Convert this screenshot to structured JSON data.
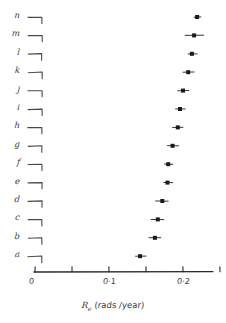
{
  "chart_data": {
    "type": "scatter",
    "title": "",
    "xlabel": "R_e (rads/year)",
    "xlabel_symbol": "R",
    "xlabel_subscript": "e",
    "xlabel_units": "(rads /year)",
    "ylabel": "",
    "xlim": [
      0,
      0.25
    ],
    "grid": false,
    "legend": null,
    "orientation": "horizontal",
    "style": "hand-drawn dot plot with horizontal error bars",
    "xticks": [
      0,
      0.05,
      0.1,
      0.15,
      0.2,
      0.25
    ],
    "xtick_labels": [
      "0",
      "",
      "0·1",
      "",
      "0·2",
      ""
    ],
    "categories": [
      "a",
      "b",
      "c",
      "d",
      "e",
      "f",
      "g",
      "h",
      "i",
      "j",
      "k",
      "l",
      "m",
      "n"
    ],
    "values": [
      0.142,
      0.162,
      0.166,
      0.172,
      0.179,
      0.18,
      0.186,
      0.193,
      0.196,
      0.2,
      0.207,
      0.212,
      0.215,
      0.219
    ],
    "errors_low": [
      0.136,
      0.154,
      0.157,
      0.163,
      0.174,
      0.175,
      0.179,
      0.186,
      0.19,
      0.193,
      0.2,
      0.207,
      0.203,
      0.215
    ],
    "errors_high": [
      0.15,
      0.17,
      0.174,
      0.18,
      0.186,
      0.186,
      0.194,
      0.2,
      0.203,
      0.208,
      0.215,
      0.219,
      0.228,
      0.224
    ],
    "points": [
      {
        "category": "n",
        "value": 0.219,
        "low": 0.215,
        "high": 0.224
      },
      {
        "category": "m",
        "value": 0.215,
        "low": 0.203,
        "high": 0.228
      },
      {
        "category": "l",
        "value": 0.212,
        "low": 0.207,
        "high": 0.219
      },
      {
        "category": "k",
        "value": 0.207,
        "low": 0.2,
        "high": 0.215
      },
      {
        "category": "j",
        "value": 0.2,
        "low": 0.193,
        "high": 0.208
      },
      {
        "category": "i",
        "value": 0.196,
        "low": 0.19,
        "high": 0.203
      },
      {
        "category": "h",
        "value": 0.193,
        "low": 0.186,
        "high": 0.2
      },
      {
        "category": "g",
        "value": 0.186,
        "low": 0.179,
        "high": 0.194
      },
      {
        "category": "f",
        "value": 0.18,
        "low": 0.175,
        "high": 0.186
      },
      {
        "category": "e",
        "value": 0.179,
        "low": 0.174,
        "high": 0.186
      },
      {
        "category": "d",
        "value": 0.172,
        "low": 0.163,
        "high": 0.18
      },
      {
        "category": "c",
        "value": 0.166,
        "low": 0.157,
        "high": 0.174
      },
      {
        "category": "b",
        "value": 0.162,
        "low": 0.154,
        "high": 0.17
      },
      {
        "category": "a",
        "value": 0.142,
        "low": 0.136,
        "high": 0.15
      }
    ]
  },
  "colors": {
    "ink": "#2b2b2b",
    "background": "#ffffff",
    "marker": "#1a1a1a"
  }
}
